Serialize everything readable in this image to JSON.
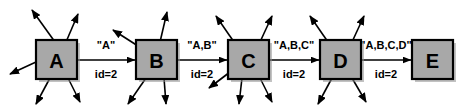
{
  "diagram": {
    "type": "node-link-flow",
    "orientation": "left-to-right",
    "canvas": {
      "width": 468,
      "height": 108
    },
    "style": {
      "node_fill": "#a8a8a8",
      "node_stroke": "#000000",
      "background": "#ffffff",
      "arrow_color": "#000000"
    },
    "nodes": [
      {
        "id": "A",
        "label": "A",
        "x": 36,
        "y": 40,
        "w": 41,
        "h": 39
      },
      {
        "id": "B",
        "label": "B",
        "x": 136,
        "y": 40,
        "w": 41,
        "h": 39
      },
      {
        "id": "C",
        "label": "C",
        "x": 228,
        "y": 40,
        "w": 41,
        "h": 39
      },
      {
        "id": "D",
        "label": "D",
        "x": 320,
        "y": 40,
        "w": 41,
        "h": 39
      },
      {
        "id": "E",
        "label": "E",
        "x": 412,
        "y": 40,
        "w": 41,
        "h": 39
      }
    ],
    "edges": [
      {
        "from": "A",
        "to": "B",
        "message": "\"A\"",
        "id_label": "id=2",
        "x1": 77,
        "x2": 135,
        "y": 60
      },
      {
        "from": "B",
        "to": "C",
        "message": "\"A,B\"",
        "id_label": "id=2",
        "x1": 177,
        "x2": 227,
        "y": 60
      },
      {
        "from": "C",
        "to": "D",
        "message": "\"A,B,C\"",
        "id_label": "id=2",
        "x1": 269,
        "x2": 319,
        "y": 60
      },
      {
        "from": "D",
        "to": "E",
        "message": "\"A,B,C,D\"",
        "id_label": "id=2",
        "x1": 361,
        "x2": 411,
        "y": 60
      }
    ],
    "external_arrows": {
      "A": [
        {
          "x1": 55,
          "y1": 42,
          "x2": 32,
          "y2": 10
        },
        {
          "x1": 66,
          "y1": 42,
          "x2": 78,
          "y2": 14
        },
        {
          "x1": 36,
          "y1": 62,
          "x2": 10,
          "y2": 74
        },
        {
          "x1": 50,
          "y1": 78,
          "x2": 36,
          "y2": 104
        },
        {
          "x1": 68,
          "y1": 78,
          "x2": 80,
          "y2": 102
        }
      ],
      "B": [
        {
          "x1": 138,
          "y1": 46,
          "x2": 113,
          "y2": 30
        },
        {
          "x1": 160,
          "y1": 42,
          "x2": 167,
          "y2": 12
        },
        {
          "x1": 146,
          "y1": 78,
          "x2": 128,
          "y2": 104
        },
        {
          "x1": 164,
          "y1": 78,
          "x2": 166,
          "y2": 104
        }
      ],
      "C": [
        {
          "x1": 234,
          "y1": 42,
          "x2": 216,
          "y2": 16
        },
        {
          "x1": 260,
          "y1": 42,
          "x2": 272,
          "y2": 16
        },
        {
          "x1": 230,
          "y1": 72,
          "x2": 209,
          "y2": 88
        },
        {
          "x1": 242,
          "y1": 78,
          "x2": 239,
          "y2": 104
        },
        {
          "x1": 260,
          "y1": 78,
          "x2": 272,
          "y2": 102
        }
      ],
      "D": [
        {
          "x1": 328,
          "y1": 42,
          "x2": 310,
          "y2": 16
        },
        {
          "x1": 352,
          "y1": 42,
          "x2": 364,
          "y2": 16
        },
        {
          "x1": 332,
          "y1": 78,
          "x2": 318,
          "y2": 104
        },
        {
          "x1": 352,
          "y1": 78,
          "x2": 366,
          "y2": 102
        }
      ],
      "E": []
    }
  }
}
